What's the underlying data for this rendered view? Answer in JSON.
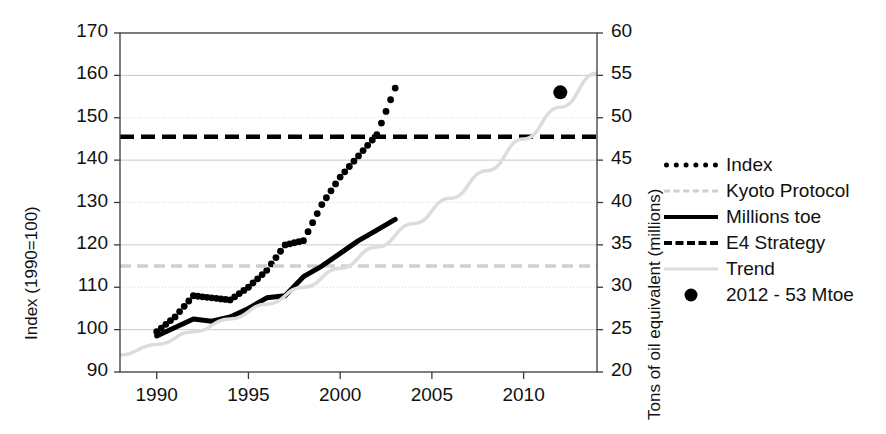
{
  "chart_data": {
    "type": "line",
    "title": "",
    "xlabel": "",
    "ylabel": "Index (1990=100)",
    "y2label": "Tons of oil equivalent (millions)",
    "xlim": [
      1988,
      2014
    ],
    "ylim": [
      90,
      170
    ],
    "y2lim": [
      20,
      60
    ],
    "ytick_step": 10,
    "y2tick_step": 5,
    "grid": true,
    "legend_position": "right",
    "xticks": [
      "1990",
      "1995",
      "2000",
      "2005",
      "2010"
    ],
    "xtick_values": [
      1990,
      1995,
      2000,
      2005,
      2010
    ],
    "yticks": [
      "90",
      "100",
      "110",
      "120",
      "130",
      "140",
      "150",
      "160",
      "170"
    ],
    "ytick_values": [
      90,
      100,
      110,
      120,
      130,
      140,
      150,
      160,
      170
    ],
    "y2ticks": [
      "20",
      "25",
      "30",
      "35",
      "40",
      "45",
      "50",
      "55",
      "60"
    ],
    "y2tick_values": [
      20,
      25,
      30,
      35,
      40,
      45,
      50,
      55,
      60
    ],
    "series": [
      {
        "name": "Index",
        "style": "dotted",
        "color": "#000000",
        "x": [
          1990,
          1991,
          1992,
          1993,
          1994,
          1995,
          1996,
          1997,
          1998,
          1999,
          2000,
          2001,
          2002,
          2003
        ],
        "values": [
          99.5,
          103.0,
          108.0,
          107.5,
          107.0,
          110.0,
          114.0,
          120.0,
          121.0,
          129.5,
          136.0,
          141.0,
          146.0,
          157.0
        ]
      },
      {
        "name": "Kyoto Protocol",
        "style": "light-dashed",
        "color": "#cfcfcf",
        "x": [
          1988,
          2014
        ],
        "values": [
          115.0,
          115.0
        ]
      },
      {
        "name": "Millions toe",
        "style": "solid",
        "color": "#000000",
        "x": [
          1990,
          1991,
          1992,
          1993,
          1994,
          1995,
          1996,
          1997,
          1998,
          1999,
          2000,
          2001,
          2002,
          2003
        ],
        "values": [
          98.5,
          100.5,
          102.5,
          102.0,
          103.0,
          105.0,
          107.5,
          108.0,
          112.5,
          115.0,
          118.0,
          121.0,
          123.5,
          126.0
        ]
      },
      {
        "name": "E4 Strategy",
        "style": "dashed",
        "color": "#000000",
        "x": [
          1988,
          2014
        ],
        "values": [
          145.5,
          145.5
        ]
      },
      {
        "name": "Trend",
        "style": "light-solid",
        "color": "#dcdcdc",
        "x": [
          1988,
          1990,
          1992,
          1994,
          1996,
          1998,
          2000,
          2002,
          2004,
          2006,
          2008,
          2010,
          2012,
          2014
        ],
        "values": [
          94.0,
          96.5,
          99.5,
          102.5,
          106.0,
          110.0,
          114.5,
          119.5,
          125.0,
          131.0,
          137.5,
          145.0,
          152.5,
          160.5
        ]
      },
      {
        "name": "2012 - 53 Mtoe",
        "style": "marker",
        "color": "#000000",
        "x": [
          2012
        ],
        "values": [
          156.0
        ]
      }
    ]
  },
  "axes": {
    "left_title": "Index (1990=100)",
    "right_title": "Tons of oil equivalent (millions)"
  },
  "legend": {
    "items": [
      {
        "label": "Index",
        "sample": "dotted-line-sample"
      },
      {
        "label": "Kyoto Protocol",
        "sample": "light-dashed-line-sample"
      },
      {
        "label": "Millions toe",
        "sample": "solid-line-sample"
      },
      {
        "label": "E4 Strategy",
        "sample": "dashed-line-sample"
      },
      {
        "label": "Trend",
        "sample": "light-solid-line-sample"
      },
      {
        "label": "2012 - 53 Mtoe",
        "sample": "dot-marker-sample"
      }
    ]
  }
}
